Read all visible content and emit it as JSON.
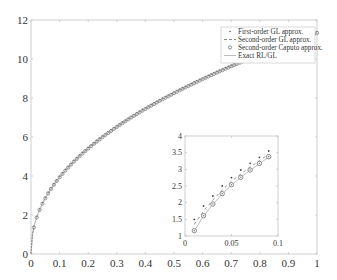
{
  "chart_data": [
    {
      "type": "line",
      "title": "",
      "xlabel": "",
      "ylabel": "",
      "xlim": [
        0,
        1
      ],
      "ylim": [
        0,
        12
      ],
      "grid": false,
      "legend_position": "upper right",
      "x_ticks": [
        0,
        0.1,
        0.2,
        0.3,
        0.4,
        0.5,
        0.6,
        0.7,
        0.8,
        0.9,
        1
      ],
      "x_tick_labels": [
        "0",
        "0.1",
        "0.2",
        "0.3",
        "0.4",
        "0.5",
        "0.6",
        "0.7",
        "0.8",
        "0.9",
        "1"
      ],
      "y_ticks": [
        0,
        2,
        4,
        6,
        8,
        10,
        12
      ],
      "y_tick_labels": [
        "0",
        "2",
        "4",
        "6",
        "8",
        "10",
        "12"
      ],
      "legend": [
        "First-order GL approx.",
        "Second-order GL approx.",
        "Second-order Caputo approx.",
        "Exact RL/GL"
      ],
      "x": [
        0,
        0.01,
        0.02,
        0.05,
        0.1,
        0.15,
        0.2,
        0.25,
        0.3,
        0.35,
        0.4,
        0.45,
        0.5,
        0.55,
        0.6,
        0.65,
        0.7,
        0.75,
        0.8,
        0.85,
        0.9,
        0.95,
        1.0
      ],
      "series": [
        {
          "name": "First-order GL approx.",
          "marker": "dot",
          "values": [
            0,
            1.35,
            1.87,
            2.85,
            3.95,
            4.75,
            5.42,
            6.0,
            6.52,
            7.0,
            7.44,
            7.86,
            8.25,
            8.62,
            8.97,
            9.31,
            9.64,
            9.95,
            10.25,
            10.55,
            10.83,
            11.1,
            11.37
          ]
        },
        {
          "name": "Second-order GL approx.",
          "marker": "dash",
          "values": [
            0,
            1.2,
            1.7,
            2.7,
            3.85,
            4.68,
            5.36,
            5.95,
            6.48,
            6.96,
            7.41,
            7.83,
            8.22,
            8.6,
            8.95,
            9.29,
            9.62,
            9.93,
            10.23,
            10.53,
            10.81,
            11.08,
            11.35
          ]
        },
        {
          "name": "Second-order Caputo approx.",
          "marker": "circle",
          "values": [
            0,
            1.16,
            1.61,
            2.54,
            3.8,
            4.65,
            5.34,
            5.93,
            6.46,
            6.95,
            7.4,
            7.82,
            8.21,
            8.59,
            8.94,
            9.28,
            9.61,
            9.92,
            10.22,
            10.52,
            10.8,
            11.07,
            11.34
          ]
        },
        {
          "name": "Exact RL/GL",
          "marker": "line",
          "values": [
            0,
            1.15,
            1.6,
            2.53,
            3.8,
            4.65,
            5.34,
            5.93,
            6.46,
            6.95,
            7.4,
            7.82,
            8.21,
            8.59,
            8.94,
            9.28,
            9.61,
            9.92,
            10.22,
            10.52,
            10.8,
            11.07,
            11.34
          ]
        }
      ]
    },
    {
      "type": "line",
      "title": "inset (zoom near origin)",
      "xlim": [
        0,
        0.1
      ],
      "ylim": [
        1,
        4
      ],
      "x_ticks": [
        0,
        0.05,
        0.1
      ],
      "x_tick_labels": [
        "0",
        "0.05",
        "0.1"
      ],
      "y_ticks": [
        1,
        1.5,
        2,
        2.5,
        3,
        3.5,
        4
      ],
      "y_tick_labels": [
        "1",
        "1.5",
        "2",
        "2.5",
        "3",
        "3.5",
        "4"
      ],
      "x": [
        0.01,
        0.02,
        0.03,
        0.04,
        0.05,
        0.06,
        0.07,
        0.08,
        0.09
      ],
      "series": [
        {
          "name": "First-order GL approx.",
          "marker": "dot",
          "values": [
            1.5,
            1.9,
            2.2,
            2.5,
            2.75,
            2.98,
            3.18,
            3.36,
            3.55
          ]
        },
        {
          "name": "Second-order GL approx.",
          "marker": "dash",
          "values": [
            1.35,
            1.75,
            2.08,
            2.38,
            2.64,
            2.86,
            3.07,
            3.26,
            3.45
          ]
        },
        {
          "name": "Second-order Caputo approx.",
          "marker": "circle",
          "values": [
            1.16,
            1.61,
            1.96,
            2.27,
            2.54,
            2.76,
            2.98,
            3.18,
            3.38
          ]
        },
        {
          "name": "Exact RL/GL",
          "marker": "line",
          "values": [
            1.15,
            1.6,
            1.95,
            2.26,
            2.53,
            2.76,
            2.97,
            3.17,
            3.37
          ]
        }
      ]
    }
  ],
  "colors": {
    "axis": "#cfcfcf",
    "text": "#333333",
    "marker": "#8a8a8a",
    "line": "#bdbdbd"
  }
}
